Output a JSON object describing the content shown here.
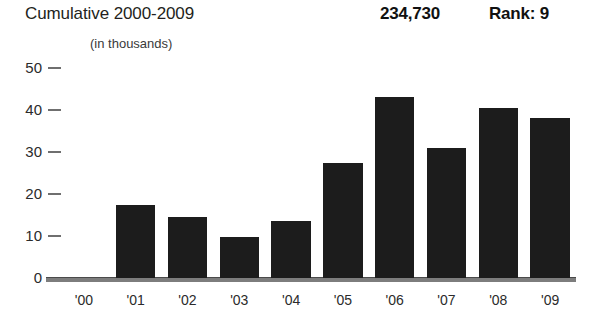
{
  "header": {
    "title": "Cumulative 2000-2009",
    "total": "234,730",
    "rank": "Rank: 9",
    "subtitle": "(in thousands)"
  },
  "chart_data": {
    "type": "bar",
    "title": "Cumulative 2000-2009",
    "subtitle": "(in thousands)",
    "xlabel": "",
    "ylabel": "",
    "categories": [
      "'00",
      "'01",
      "'02",
      "'03",
      "'04",
      "'05",
      "'06",
      "'07",
      "'08",
      "'09"
    ],
    "values": [
      0,
      17.5,
      14.5,
      9.8,
      13.5,
      27.5,
      43,
      31,
      40.5,
      38
    ],
    "ylim": [
      0,
      50
    ],
    "yticks": [
      0,
      10,
      20,
      30,
      40,
      50
    ],
    "ytick_labels": [
      "0",
      "10",
      "20",
      "30",
      "40",
      "50"
    ],
    "grid": false,
    "legend": null,
    "annotations": {
      "total_value": "234,730",
      "rank_value": "Rank: 9"
    },
    "bar_color": "#1c1c1c",
    "axis_color": "#7d7d7d"
  }
}
